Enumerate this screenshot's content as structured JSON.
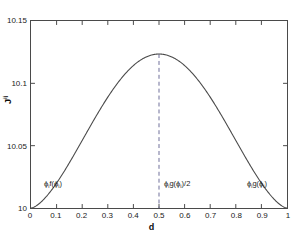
{
  "chart_data": {
    "type": "line",
    "title": "",
    "xlabel": "d",
    "ylabel": "J",
    "ylabel_sup": "ij",
    "xlim": [
      0,
      1
    ],
    "ylim": [
      10,
      10.15
    ],
    "grid": false,
    "legend": "none",
    "xticks": [
      "0",
      "0.1",
      "0.2",
      "0.3",
      "0.4",
      "0.5",
      "0.6",
      "0.7",
      "0.8",
      "0.9",
      "1"
    ],
    "xtick_values": [
      0,
      0.1,
      0.2,
      0.3,
      0.4,
      0.5,
      0.6,
      0.7,
      0.8,
      0.9,
      1
    ],
    "yticks": [
      "10",
      "10.05",
      "10.1",
      "10.15"
    ],
    "ytick_values": [
      10,
      10.05,
      10.1,
      10.15
    ],
    "series": [
      {
        "name": "J^ij(d)",
        "style": "solid",
        "color": "#4a4a4a",
        "x": [
          0,
          0.025,
          0.05,
          0.075,
          0.1,
          0.125,
          0.15,
          0.175,
          0.2,
          0.225,
          0.25,
          0.275,
          0.3,
          0.325,
          0.35,
          0.375,
          0.4,
          0.425,
          0.45,
          0.475,
          0.5,
          0.525,
          0.55,
          0.575,
          0.6,
          0.625,
          0.65,
          0.675,
          0.7,
          0.725,
          0.75,
          0.775,
          0.8,
          0.825,
          0.85,
          0.875,
          0.9,
          0.925,
          0.95,
          0.975,
          1
        ],
        "y": [
          10.0,
          10.0123,
          10.0239,
          10.0348,
          10.045,
          10.0545,
          10.0633,
          10.0715,
          10.079,
          10.0858,
          10.092,
          10.0975,
          10.1023,
          10.1065,
          10.11,
          10.1129,
          10.1151,
          10.1167,
          10.1176,
          10.1178,
          10.1235,
          10.1178,
          10.1176,
          10.1167,
          10.1151,
          10.1129,
          10.11,
          10.1065,
          10.1023,
          10.0975,
          10.092,
          10.0858,
          10.079,
          10.0715,
          10.0633,
          10.0545,
          10.045,
          10.0348,
          10.0239,
          10.0123,
          10.0
        ]
      }
    ],
    "reference_lines": [
      {
        "name": "peak-marker",
        "orientation": "vertical",
        "x": 0.5,
        "style": "dashed",
        "color": "#6e6e99"
      }
    ],
    "peak": {
      "x": 0.5,
      "y": 10.1235
    },
    "endpoints": [
      {
        "x": 0,
        "y": 10.0
      },
      {
        "x": 1,
        "y": 10.0
      }
    ],
    "annotations": [
      {
        "id": "left",
        "text": "ϕᵢf(ϕᵢ)",
        "x": 0.06,
        "y": 10.008
      },
      {
        "id": "mid",
        "text": "ϕᵢg(ϕᵢ)/2",
        "x": 0.52,
        "y": 10.008
      },
      {
        "id": "right",
        "text": "ϕᵢg(ϕᵢ)",
        "x": 0.86,
        "y": 10.008
      }
    ]
  },
  "axes": {
    "xlabel": "d",
    "ylabel_base": "J",
    "ylabel_sup": "ij",
    "xticks": [
      "0",
      "0.1",
      "0.2",
      "0.3",
      "0.4",
      "0.5",
      "0.6",
      "0.7",
      "0.8",
      "0.9",
      "1"
    ],
    "yticks": [
      "10",
      "10.05",
      "10.1",
      "10.15"
    ]
  },
  "annotations": {
    "left": {
      "base": "ϕ",
      "sub": "i",
      "rest": "f(ϕ",
      "sub2": "i",
      "tail": ")"
    },
    "left_text": "ϕif(ϕi)",
    "mid_text": "ϕig(ϕi)/2",
    "right_text": "ϕig(ϕi)"
  },
  "colors": {
    "curve": "#4a4a4a",
    "dashed": "#6e6e99",
    "axis": "#4a4a4a",
    "text": "#1a1a1a",
    "background": "#ffffff"
  }
}
